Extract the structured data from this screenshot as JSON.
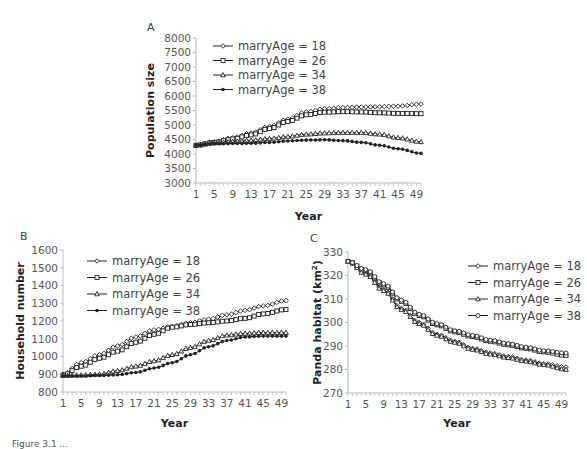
{
  "figure": {
    "caption_partial": "Figure 3.1 ..."
  },
  "series_names": [
    "marryAge = 18",
    "marryAge = 26",
    "marryAge = 34",
    "marryAge = 38"
  ],
  "chart_data": [
    {
      "panel": "A",
      "type": "line",
      "title": "",
      "xlabel": "Year",
      "ylabel": "Population size",
      "xlim": [
        1,
        50
      ],
      "ylim": [
        3000,
        8000
      ],
      "yticks": [
        3000,
        3500,
        4000,
        4500,
        5000,
        5500,
        6000,
        6500,
        7000,
        7500,
        8000
      ],
      "xticks": [
        1,
        5,
        9,
        13,
        17,
        21,
        25,
        29,
        33,
        37,
        41,
        45,
        49
      ],
      "grid": false,
      "legend_position": "upper-left",
      "x": [
        1,
        5,
        9,
        13,
        17,
        21,
        25,
        29,
        33,
        37,
        41,
        45,
        50
      ],
      "series": [
        {
          "name": "marryAge = 18",
          "marker": "diamond",
          "values": [
            4300,
            4420,
            4560,
            4720,
            4950,
            5200,
            5450,
            5560,
            5600,
            5620,
            5630,
            5650,
            5720
          ]
        },
        {
          "name": "marryAge = 26",
          "marker": "square",
          "values": [
            4300,
            4400,
            4520,
            4660,
            4880,
            5120,
            5350,
            5440,
            5460,
            5450,
            5420,
            5400,
            5390
          ]
        },
        {
          "name": "marryAge = 34",
          "marker": "triangle",
          "values": [
            4300,
            4380,
            4430,
            4470,
            4530,
            4600,
            4680,
            4720,
            4740,
            4740,
            4680,
            4560,
            4420
          ]
        },
        {
          "name": "marryAge = 38",
          "marker": "dot",
          "values": [
            4300,
            4350,
            4360,
            4370,
            4400,
            4450,
            4480,
            4490,
            4460,
            4400,
            4300,
            4180,
            4020
          ]
        }
      ]
    },
    {
      "panel": "B",
      "type": "line",
      "title": "",
      "xlabel": "Year",
      "ylabel": "Household number",
      "xlim": [
        1,
        50
      ],
      "ylim": [
        800,
        1600
      ],
      "yticks": [
        800,
        900,
        1000,
        1100,
        1200,
        1300,
        1400,
        1500,
        1600
      ],
      "xticks": [
        1,
        5,
        9,
        13,
        17,
        21,
        25,
        29,
        33,
        37,
        41,
        45,
        49
      ],
      "grid": false,
      "legend_position": "upper-left",
      "x": [
        1,
        5,
        9,
        13,
        17,
        21,
        25,
        29,
        33,
        37,
        41,
        45,
        50
      ],
      "series": [
        {
          "name": "marryAge = 18",
          "marker": "diamond",
          "values": [
            900,
            965,
            1010,
            1060,
            1110,
            1150,
            1170,
            1190,
            1210,
            1235,
            1260,
            1285,
            1315
          ]
        },
        {
          "name": "marryAge = 26",
          "marker": "square",
          "values": [
            895,
            945,
            990,
            1030,
            1080,
            1125,
            1165,
            1180,
            1190,
            1200,
            1215,
            1240,
            1265
          ]
        },
        {
          "name": "marryAge = 34",
          "marker": "triangle",
          "values": [
            893,
            895,
            900,
            920,
            945,
            975,
            1010,
            1050,
            1090,
            1120,
            1130,
            1135,
            1135
          ]
        },
        {
          "name": "marryAge = 38",
          "marker": "dot",
          "values": [
            890,
            890,
            893,
            897,
            910,
            935,
            965,
            1010,
            1055,
            1090,
            1110,
            1115,
            1115
          ]
        }
      ]
    },
    {
      "panel": "C",
      "type": "line",
      "title": "",
      "xlabel": "Year",
      "ylabel": "Panda habitat (km²)",
      "xlim": [
        1,
        50
      ],
      "ylim": [
        270,
        330
      ],
      "yticks": [
        270,
        280,
        290,
        300,
        310,
        320,
        330
      ],
      "xticks": [
        1,
        5,
        9,
        13,
        17,
        21,
        25,
        29,
        33,
        37,
        41,
        45,
        49
      ],
      "grid": false,
      "legend_position": "upper-right",
      "x": [
        1,
        5,
        9,
        13,
        17,
        21,
        25,
        29,
        33,
        37,
        41,
        45,
        50
      ],
      "series": [
        {
          "name": "marryAge = 18",
          "marker": "diamond",
          "values": [
            326,
            321,
            314,
            306,
            300,
            295,
            292,
            289,
            287,
            285.5,
            284,
            282.5,
            281
          ]
        },
        {
          "name": "marryAge = 26",
          "marker": "square",
          "values": [
            326,
            322,
            316,
            309,
            303,
            299,
            296,
            294,
            292,
            290.5,
            289,
            287.5,
            286
          ]
        },
        {
          "name": "marryAge = 34",
          "marker": "triangle",
          "values": [
            326,
            320.5,
            313.5,
            305.5,
            299.5,
            294.5,
            291.5,
            288.5,
            286.5,
            285,
            283.5,
            282,
            280
          ]
        },
        {
          "name": "marryAge = 38",
          "marker": "circle",
          "values": [
            326,
            322.5,
            316.5,
            309.5,
            303.5,
            299.5,
            296.5,
            294.5,
            292.5,
            291,
            289.5,
            288,
            287
          ]
        }
      ]
    }
  ]
}
